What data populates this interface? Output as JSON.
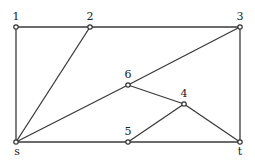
{
  "graph": {
    "nodes": [
      {
        "id": "1",
        "label": "1",
        "x": 16,
        "y": 27,
        "lx": 16,
        "ly": 20
      },
      {
        "id": "2",
        "label": "2",
        "x": 90,
        "y": 27,
        "lx": 90,
        "ly": 20
      },
      {
        "id": "3",
        "label": "3",
        "x": 240,
        "y": 27,
        "lx": 240,
        "ly": 20
      },
      {
        "id": "6",
        "label": "6",
        "x": 128,
        "y": 85,
        "lx": 128,
        "ly": 78
      },
      {
        "id": "4",
        "label": "4",
        "x": 184,
        "y": 104,
        "lx": 184,
        "ly": 97
      },
      {
        "id": "5",
        "label": "5",
        "x": 128,
        "y": 142,
        "lx": 128,
        "ly": 135
      },
      {
        "id": "s",
        "label": "s",
        "x": 16,
        "y": 142,
        "lx": 17,
        "ly": 155
      },
      {
        "id": "t",
        "label": "t",
        "x": 240,
        "y": 142,
        "lx": 240,
        "ly": 155
      }
    ],
    "edges": [
      [
        "1",
        "2"
      ],
      [
        "2",
        "3"
      ],
      [
        "1",
        "s"
      ],
      [
        "2",
        "s"
      ],
      [
        "s",
        "6"
      ],
      [
        "6",
        "3"
      ],
      [
        "3",
        "t"
      ],
      [
        "6",
        "4"
      ],
      [
        "4",
        "t"
      ],
      [
        "5",
        "4"
      ],
      [
        "s",
        "5"
      ],
      [
        "5",
        "t"
      ]
    ]
  }
}
